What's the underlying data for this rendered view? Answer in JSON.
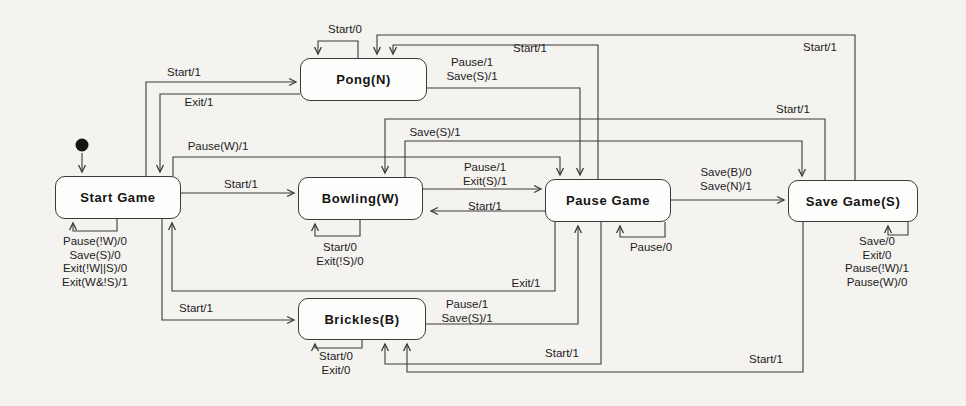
{
  "diagram_type": "game-state-machine",
  "states": {
    "start_game": "Start Game",
    "pong": "Pong(N)",
    "bowling": "Bowling(W)",
    "brickles": "Brickles(B)",
    "pause_game": "Pause Game",
    "save_game": "Save Game(S)"
  },
  "transitions": {
    "start_to_pong": {
      "from": "Start Game",
      "to": "Pong(N)",
      "labels": [
        "Start/1"
      ]
    },
    "pong_to_start": {
      "from": "Pong(N)",
      "to": "Start Game",
      "labels": [
        "Exit/1"
      ]
    },
    "start_to_bowling": {
      "from": "Start Game",
      "to": "Bowling(W)",
      "labels": [
        "Start/1"
      ]
    },
    "start_to_brickles": {
      "from": "Start Game",
      "to": "Brickles(B)",
      "labels": [
        "Start/1"
      ]
    },
    "start_to_pause": {
      "from": "Start Game",
      "to": "Pause Game",
      "labels": [
        "Pause(W)/1"
      ]
    },
    "pong_to_pause": {
      "from": "Pong(N)",
      "to": "Pause Game",
      "labels": [
        "Pause/1",
        "Save(S)/1"
      ]
    },
    "pause_to_pong": {
      "from": "Pause Game",
      "to": "Pong(N)",
      "labels": [
        "Start/1"
      ]
    },
    "save_to_pong": {
      "from": "Save Game(S)",
      "to": "Pong(N)",
      "labels": [
        "Start/1"
      ]
    },
    "save_to_bowling": {
      "from": "Save Game(S)",
      "to": "Bowling(W)",
      "labels": [
        "Start/1"
      ]
    },
    "bowling_to_save": {
      "from": "Bowling(W)",
      "to": "Save Game(S)",
      "labels": [
        "Save(S)/1"
      ]
    },
    "bowling_to_pause": {
      "from": "Bowling(W)",
      "to": "Pause Game",
      "labels": [
        "Pause/1",
        "Exit(S)/1"
      ]
    },
    "pause_to_bowling": {
      "from": "Pause Game",
      "to": "Bowling(W)",
      "labels": [
        "Start/1"
      ]
    },
    "pause_to_save": {
      "from": "Pause Game",
      "to": "Save Game(S)",
      "labels": [
        "Save(B)/0",
        "Save(N)/1"
      ]
    },
    "pause_to_start": {
      "from": "Pause Game",
      "to": "Start Game",
      "labels": [
        "Exit/1"
      ]
    },
    "brickles_to_pause": {
      "from": "Brickles(B)",
      "to": "Pause Game",
      "labels": [
        "Pause/1",
        "Save(S)/1"
      ]
    },
    "pause_to_brickles": {
      "from": "Pause Game",
      "to": "Brickles(B)",
      "labels": [
        "Start/1"
      ]
    },
    "save_to_brickles": {
      "from": "Save Game(S)",
      "to": "Brickles(B)",
      "labels": [
        "Start/1"
      ]
    }
  },
  "self_loops": {
    "start_game": [
      "Pause(!W)/0",
      "Save(S)/0",
      "Exit(!W||S)/0",
      "Exit(W&!S)/1"
    ],
    "pong": [
      "Start/0"
    ],
    "bowling": [
      "Start/0",
      "Exit(!S)/0"
    ],
    "brickles": [
      "Start/0",
      "Exit/0"
    ],
    "pause_game": [
      "Pause/0"
    ],
    "save_game": [
      "Save/0",
      "Exit/0",
      "Pause(!W)/1",
      "Pause(W)/0"
    ]
  }
}
